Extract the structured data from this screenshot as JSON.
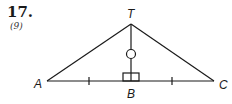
{
  "problem": {
    "number": "17.",
    "reference": "(9)"
  },
  "figure": {
    "vertices": {
      "apex": "T",
      "left": "A",
      "foot": "B",
      "right": "C"
    },
    "markings": {
      "congruent_segments": [
        "AB",
        "BC"
      ],
      "right_angle_at": "B",
      "altitude_mark": "circle",
      "altitude": "TB"
    },
    "line_color": "#1a1a1a"
  }
}
